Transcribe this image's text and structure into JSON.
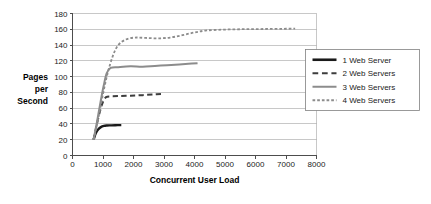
{
  "chart_data": {
    "type": "line",
    "title": "",
    "xlabel": "Concurrent User Load",
    "ylabel": "Pages per Second",
    "ylabel_lines": [
      "Pages",
      "per",
      "Second"
    ],
    "xlim": [
      0,
      8000
    ],
    "ylim": [
      0,
      180
    ],
    "xticks": [
      0,
      1000,
      2000,
      3000,
      4000,
      5000,
      6000,
      7000,
      8000
    ],
    "yticks": [
      0,
      20,
      40,
      60,
      80,
      100,
      120,
      140,
      160,
      180
    ],
    "xtick_labels": [
      "0",
      "1000",
      "2000",
      "3000",
      "4000",
      "5000",
      "6000",
      "7000",
      "8000"
    ],
    "ytick_labels": [
      "0",
      "20",
      "40",
      "60",
      "80",
      "100",
      "120",
      "140",
      "160",
      "180"
    ],
    "grid": "horizontal",
    "legend_position": "right",
    "series": [
      {
        "name": "1 Web Server",
        "color": "#1a1a1a",
        "style": "solid",
        "width": 2.4,
        "x": [
          690,
          760,
          840,
          930,
          1030,
          1130,
          1250,
          1400,
          1600
        ],
        "y": [
          20,
          28,
          33,
          36,
          37.5,
          38,
          38.2,
          38.4,
          38.5
        ]
      },
      {
        "name": "2 Web Servers",
        "color": "#3d3d3d",
        "style": "dashed",
        "width": 2.0,
        "x": [
          690,
          790,
          900,
          1000,
          1100,
          1250,
          1500,
          1900,
          2300,
          2700,
          3000
        ],
        "y": [
          20,
          38,
          56,
          68,
          74,
          75,
          75.3,
          75.8,
          76.5,
          77.5,
          78
        ]
      },
      {
        "name": "3 Web Servers",
        "color": "#8c8c8c",
        "style": "solid",
        "width": 2.0,
        "x": [
          690,
          800,
          920,
          1020,
          1120,
          1250,
          1500,
          1900,
          2300,
          2700,
          3100,
          3500,
          3800,
          4100
        ],
        "y": [
          20,
          42,
          68,
          88,
          104,
          111,
          112,
          113,
          112.5,
          113.5,
          114.5,
          115.5,
          116.2,
          117
        ]
      },
      {
        "name": "4 Web Servers",
        "color": "#8c8c8c",
        "style": "dotted",
        "width": 1.8,
        "x": [
          700,
          850,
          1000,
          1150,
          1320,
          1500,
          1750,
          2050,
          2400,
          2800,
          3200,
          3600,
          4000,
          4400,
          4900,
          5400,
          5900,
          6400,
          6900,
          7300
        ],
        "y": [
          20,
          48,
          78,
          104,
          126,
          140,
          147,
          149.5,
          149,
          148.5,
          149.5,
          152.5,
          156,
          158.5,
          159.5,
          160,
          160.2,
          160.4,
          160.6,
          160.8
        ]
      }
    ],
    "legend_entries": [
      {
        "label": "1 Web Server",
        "color": "#1a1a1a",
        "style": "solid",
        "width": 2.6
      },
      {
        "label": "2 Web Servers",
        "color": "#3d3d3d",
        "style": "dashed",
        "width": 2.2
      },
      {
        "label": "3 Web Servers",
        "color": "#8c8c8c",
        "style": "solid",
        "width": 2.0
      },
      {
        "label": "4 Web Servers",
        "color": "#8c8c8c",
        "style": "dotted",
        "width": 1.8
      }
    ]
  }
}
